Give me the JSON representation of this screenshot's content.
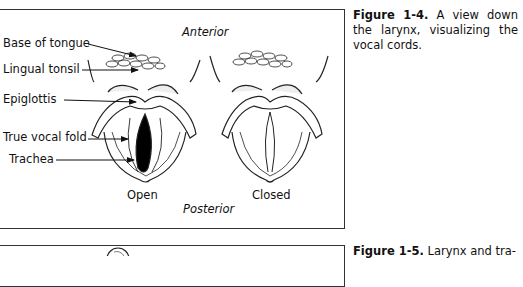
{
  "figure_1_4": {
    "labels": {
      "anterior": "Anterior",
      "posterior": "Posterior",
      "base_of_tongue": "Base of tongue",
      "lingual_tonsil": "Lingual tonsil",
      "epiglottis": "Epiglottis",
      "true_vocal_fold": "True vocal fold",
      "trachea": "Trachea",
      "open": "Open",
      "closed": "Closed"
    },
    "caption": {
      "number": "Figure 1-4.",
      "text": "A view down the larynx, visualizing the vocal cords."
    }
  },
  "figure_1_5": {
    "caption": {
      "number": "Figure 1-5.",
      "text": "Larynx and tra-"
    }
  }
}
